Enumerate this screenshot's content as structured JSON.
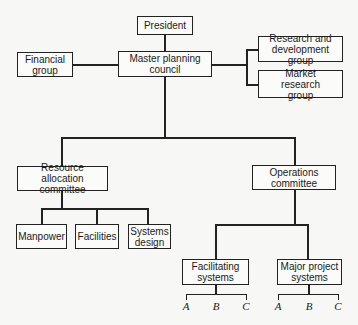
{
  "chart": {
    "nodes": {
      "president": "President",
      "master": "Master planning council",
      "financial": "Financial group",
      "rnd": "Research and development group",
      "market": "Market research group",
      "resource": "Resource allocation committee",
      "operations": "Operations committee",
      "manpower": "Manpower",
      "facilities": "Facilities",
      "systems_design": "Systems design",
      "facilitating": "Facilitating systems",
      "major_project": "Major project systems"
    },
    "sub_labels": {
      "facilitating": [
        "A",
        "B",
        "C"
      ],
      "major_project": [
        "A",
        "B",
        "C"
      ]
    }
  }
}
